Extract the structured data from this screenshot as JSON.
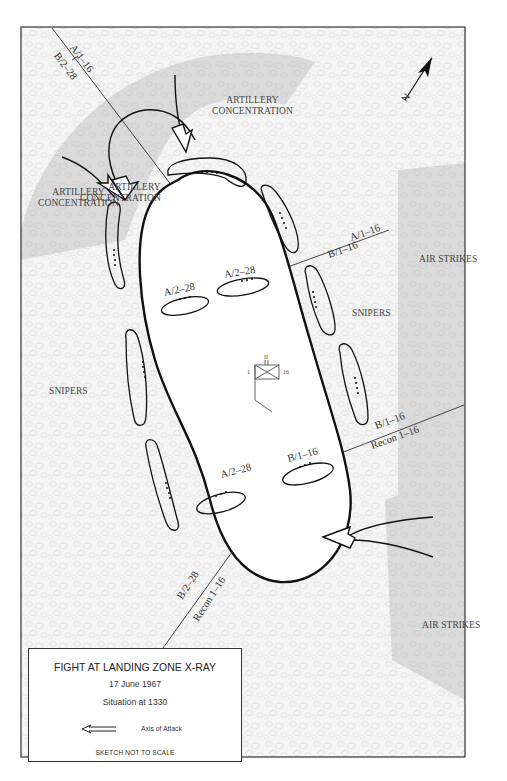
{
  "map": {
    "title": "FIGHT AT LANDING ZONE X-RAY",
    "date": "17 June 1967",
    "situation": "Situation at 1330",
    "north_label": "N",
    "colors": {
      "border": "#333333",
      "fire_zone": "#d9d9d9",
      "terrain": "#f3f3f3",
      "perimeter": "#111111"
    },
    "areas": [
      {
        "id": "artillery-north",
        "label_line1": "ARTILLERY",
        "label_line2": "CONCENTRATION"
      },
      {
        "id": "artillery-west",
        "label_line1": "ARTILLERY",
        "label_line2": "CONCENTRATION"
      },
      {
        "id": "air-strikes-east",
        "label": "AIR STRIKES"
      },
      {
        "id": "air-strikes-southeast",
        "label": "AIR STRIKES"
      },
      {
        "id": "snipers-west",
        "label": "SNIPERS"
      },
      {
        "id": "snipers-east",
        "label": "SNIPERS"
      }
    ],
    "boundaries": [
      {
        "id": "boundary-nw",
        "upper": "A/1–16",
        "lower": "B/2–28"
      },
      {
        "id": "boundary-ne",
        "upper": "A/1–16",
        "lower": "B/1–16"
      },
      {
        "id": "boundary-e",
        "upper": "B/1–16",
        "lower": "Recon 1–16"
      },
      {
        "id": "boundary-sw",
        "upper": "B/2–28",
        "lower": "Recon 1–16"
      }
    ],
    "interior_units": [
      {
        "label": "A/2–28"
      },
      {
        "label": "A/2–28"
      },
      {
        "label": "A/2–28"
      },
      {
        "label": "B/1–16"
      }
    ],
    "command_post": {
      "left": "1",
      "top": "II",
      "right": "16"
    }
  },
  "legend": {
    "axis_of_attack": "Axis of Attack",
    "scale_note": "SKETCH NOT TO SCALE"
  }
}
